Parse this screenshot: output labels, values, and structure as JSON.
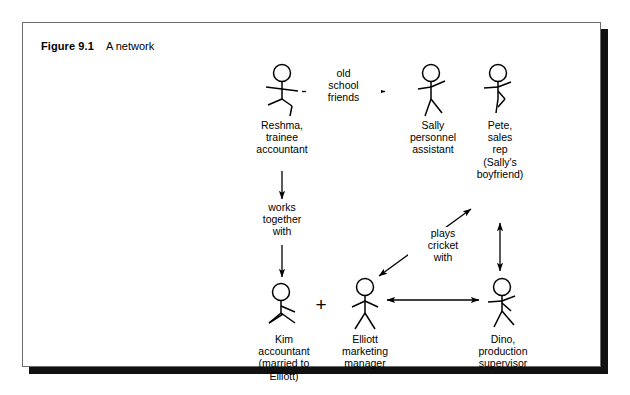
{
  "figure": {
    "number": "Figure 9.1",
    "title": "A network"
  },
  "diagram": {
    "type": "social-network-diagram",
    "people": [
      {
        "id": "reshma",
        "label": "Reshma,\ntrainee\naccountant",
        "pose": "arms-out-walking"
      },
      {
        "id": "sally",
        "label": "Sally\npersonnel\nassistant",
        "pose": "arm-up-right"
      },
      {
        "id": "pete",
        "label": "Pete,\nsales\nrep\n(Sally's\nboyfriend)",
        "pose": "arm-up-right"
      },
      {
        "id": "kim",
        "label": "Kim\naccountant\n(married to\nElliott)",
        "pose": "arms-down"
      },
      {
        "id": "elliott",
        "label": "Elliott\nmarketing\nmanager",
        "pose": "arms-down-wide"
      },
      {
        "id": "dino",
        "label": "Dino,\nproduction\nsupervisor",
        "pose": "arm-up-right"
      }
    ],
    "relations": [
      {
        "id": "old-school-friends",
        "label": "old\nschool\nfriends",
        "from": "reshma",
        "to": "sally",
        "arrow": "double-headed-horizontal"
      },
      {
        "id": "works-together-with",
        "label": "works\ntogether\nwith",
        "from": "reshma",
        "to": "kim",
        "arrow": "two-down-arrows"
      },
      {
        "id": "plays-cricket-with",
        "label": "plays\ncricket\nwith",
        "from": "elliott",
        "to": "pete",
        "arrow": "double-headed-diagonal"
      },
      {
        "id": "pete-dino-link",
        "label": "",
        "from": "pete",
        "to": "dino",
        "arrow": "double-headed-vertical"
      },
      {
        "id": "elliott-dino-link",
        "label": "",
        "from": "elliott",
        "to": "dino",
        "arrow": "double-headed-horizontal"
      },
      {
        "id": "kim-elliott-married",
        "label": "+",
        "from": "kim",
        "to": "elliott",
        "arrow": "plus-sign"
      }
    ]
  },
  "colors": {
    "ink": "#000000",
    "frame": "#6b6b6b",
    "shadow": "#111111",
    "page": "#ffffff"
  }
}
